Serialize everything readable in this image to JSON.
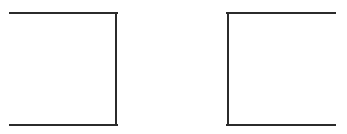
{
  "diagram": {
    "background": "#ffffff",
    "stroke_color": "#2b2b2b",
    "stroke_width": 2,
    "shapes": [
      {
        "name": "left-bracket-shape",
        "description": "Open rectangle missing its left side",
        "top": {
          "x1": 10,
          "y1": 13,
          "x2": 117,
          "y2": 13
        },
        "side": {
          "x1": 116,
          "y1": 13,
          "x2": 116,
          "y2": 125
        },
        "bottom": {
          "x1": 10,
          "y1": 125,
          "x2": 117,
          "y2": 125
        }
      },
      {
        "name": "right-bracket-shape",
        "description": "Open rectangle missing its right side",
        "top": {
          "x1": 227,
          "y1": 13,
          "x2": 335,
          "y2": 13
        },
        "side": {
          "x1": 228,
          "y1": 13,
          "x2": 228,
          "y2": 125
        },
        "bottom": {
          "x1": 227,
          "y1": 125,
          "x2": 335,
          "y2": 125
        }
      }
    ]
  }
}
